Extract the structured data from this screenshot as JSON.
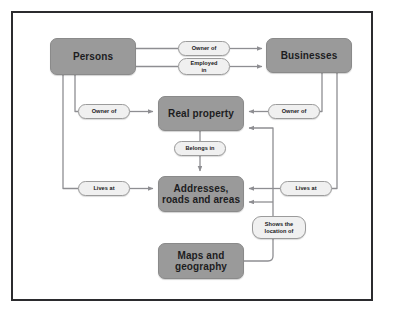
{
  "diagram": {
    "type": "flow-diagram",
    "colors": {
      "entity_fill": "#9a9a9a",
      "pill_fill": "#f0f0f0",
      "border": "#2b2b2e",
      "connector": "#8e8e92",
      "text": "#1d1d1f",
      "background": "#ffffff"
    },
    "entities": [
      {
        "id": "persons",
        "label": "Persons",
        "x": 50,
        "y": 38,
        "w": 86,
        "h": 37
      },
      {
        "id": "businesses",
        "label": "Businesses",
        "x": 266,
        "y": 38,
        "w": 86,
        "h": 35
      },
      {
        "id": "real-property",
        "label": "Real property",
        "x": 158,
        "y": 96,
        "w": 86,
        "h": 35
      },
      {
        "id": "addresses",
        "label": "Addresses, roads and areas",
        "line1": "Addresses,",
        "line2": "roads and areas",
        "x": 158,
        "y": 176,
        "w": 86,
        "h": 36
      },
      {
        "id": "maps",
        "label": "Maps and geography",
        "line1": "Maps and",
        "line2": "geography",
        "x": 158,
        "y": 243,
        "w": 86,
        "h": 36
      }
    ],
    "relationships": [
      {
        "id": "persons-owner-of-businesses",
        "label": "Owner of",
        "from": "persons",
        "to": "businesses",
        "x": 178,
        "y": 41,
        "w": 52,
        "h": 15
      },
      {
        "id": "persons-employed-in-businesses",
        "label": "Employed in",
        "line1": "Employed",
        "line2": "in",
        "from": "persons",
        "to": "businesses",
        "x": 178,
        "y": 58,
        "w": 52,
        "h": 17
      },
      {
        "id": "persons-owner-of-real-property",
        "label": "Owner of",
        "from": "persons",
        "to": "real-property",
        "x": 78,
        "y": 104,
        "w": 52,
        "h": 15
      },
      {
        "id": "businesses-owner-of-real-property",
        "label": "Owner of",
        "from": "businesses",
        "to": "real-property",
        "x": 268,
        "y": 104,
        "w": 52,
        "h": 15
      },
      {
        "id": "real-property-belongs-in-addresses",
        "label": "Belongs in",
        "from": "real-property",
        "to": "addresses",
        "x": 174,
        "y": 141,
        "w": 52,
        "h": 15
      },
      {
        "id": "persons-lives-at-addresses",
        "label": "Lives at",
        "from": "persons",
        "to": "addresses",
        "x": 78,
        "y": 181,
        "w": 52,
        "h": 15
      },
      {
        "id": "businesses-lives-at-addresses",
        "label": "Lives at",
        "from": "businesses",
        "to": "addresses",
        "x": 280,
        "y": 181,
        "w": 52,
        "h": 15
      },
      {
        "id": "maps-shows-location-of",
        "label": "Shows the location of",
        "line1": "Shows the",
        "line2": "location of",
        "from": "maps",
        "to": "real-property",
        "x": 252,
        "y": 216,
        "w": 54,
        "h": 23
      }
    ]
  }
}
